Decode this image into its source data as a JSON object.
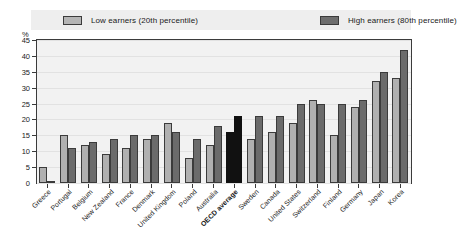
{
  "legend": {
    "low": {
      "label": "Low earners (20th percentile)",
      "color": "#b0b0b0"
    },
    "high": {
      "label": "High earners (80th percentile)",
      "color": "#6b6b6b"
    }
  },
  "axis": {
    "unit": "%",
    "ticks": [
      "45",
      "40",
      "35",
      "30",
      "25",
      "20",
      "15",
      "10",
      "5",
      "0"
    ]
  },
  "chart_data": {
    "type": "bar",
    "title": "",
    "xlabel": "",
    "ylabel": "%",
    "ylim": [
      0,
      45
    ],
    "ytick_step": 5,
    "grid": true,
    "legend_position": "top",
    "highlight_category": "OECD average",
    "highlight_color": "#111111",
    "categories": [
      "Greece",
      "Portugal",
      "Belgium",
      "New Zealand",
      "France",
      "Denmark",
      "United Kingdom",
      "Poland",
      "Australia",
      "OECD average",
      "Sweden",
      "Canada",
      "United States",
      "Switzerland",
      "Finland",
      "Germany",
      "Japan",
      "Korea"
    ],
    "series": [
      {
        "name": "Low earners (20th percentile)",
        "color": "#b0b0b0",
        "values": [
          5,
          15,
          12,
          9,
          11,
          14,
          19,
          8,
          12,
          16,
          14,
          16,
          19,
          26,
          15,
          24,
          32,
          33
        ]
      },
      {
        "name": "High earners (80th percentile)",
        "color": "#6b6b6b",
        "values": [
          0.4,
          11,
          13,
          14,
          15,
          15,
          16,
          14,
          18,
          21,
          21,
          21,
          25,
          25,
          25,
          26,
          35,
          42
        ]
      }
    ]
  }
}
